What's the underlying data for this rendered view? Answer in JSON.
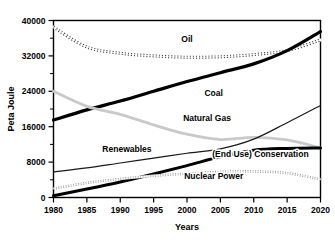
{
  "chart_data": {
    "type": "line",
    "title": "",
    "xlabel": "Years",
    "ylabel": "Peta Joule",
    "xlim": [
      1980,
      2020
    ],
    "ylim": [
      0,
      40000
    ],
    "grid": false,
    "legend_position": "inline-labels",
    "x_ticks": [
      "1980",
      "1985",
      "1990",
      "1995",
      "2000",
      "2005",
      "2010",
      "2015",
      "2020"
    ],
    "x_tick_values": [
      1980,
      1985,
      1990,
      1995,
      2000,
      2005,
      2010,
      2015,
      2020
    ],
    "y_ticks": [
      "0",
      "8000",
      "16000",
      "24000",
      "32000",
      "40000"
    ],
    "y_tick_values": [
      0,
      8000,
      16000,
      24000,
      32000,
      40000
    ],
    "y_minor_tick_values": [
      4000,
      12000,
      20000,
      28000,
      36000
    ],
    "x": [
      1980,
      1985,
      1990,
      1995,
      2000,
      2005,
      2010,
      2015,
      2020
    ],
    "series": [
      {
        "name": "Oil",
        "label": "Oil",
        "style": "hatched-dashed",
        "color": "#3a3a3a",
        "width": 3.0,
        "label_x": 2000,
        "label_y": 35200,
        "values": [
          38500,
          34000,
          32600,
          32000,
          31700,
          31800,
          32300,
          33200,
          35600
        ]
      },
      {
        "name": "Coal",
        "label": "Coal",
        "style": "solid-thick",
        "color": "#000000",
        "width": 3.2,
        "label_x": 2004,
        "label_y": 23000,
        "values": [
          17500,
          19800,
          21800,
          24000,
          26200,
          28200,
          30200,
          33200,
          37500
        ]
      },
      {
        "name": "Natural Gas",
        "label": "Natural Gas",
        "style": "solid-gray",
        "color": "#c9c9c9",
        "width": 2.8,
        "label_x": 2003,
        "label_y": 17200,
        "values": [
          24000,
          20600,
          18800,
          16400,
          14300,
          13100,
          13600,
          13000,
          11200
        ]
      },
      {
        "name": "Renewables",
        "label": "Renewables",
        "style": "solid-thin",
        "color": "#1a1a1a",
        "width": 1.2,
        "label_x": 1991,
        "label_y": 10200,
        "values": [
          5800,
          6700,
          7800,
          8900,
          10000,
          11000,
          13200,
          16900,
          20800
        ]
      },
      {
        "name": "(End Use) Conservation",
        "label": "(End Use) Conservation",
        "style": "solid-thick",
        "color": "#000000",
        "width": 3.0,
        "label_x": 2011,
        "label_y": 9200,
        "values": [
          400,
          1900,
          3500,
          5300,
          7200,
          9200,
          10700,
          11100,
          11200
        ]
      },
      {
        "name": "Nuclear Power",
        "label": "Nuclear Power",
        "style": "dotted",
        "color": "#8a8a8a",
        "width": 2.4,
        "label_x": 2004,
        "label_y": 4100,
        "values": [
          2000,
          3300,
          4200,
          4900,
          5400,
          5800,
          5900,
          5500,
          4100
        ]
      }
    ]
  }
}
